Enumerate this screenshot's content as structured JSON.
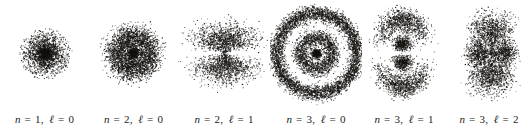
{
  "figure": {
    "name": "hydrogen-electron-probability-clouds",
    "width": 532,
    "height": 137,
    "background_color": "#ffffff",
    "dot_color": "#15120f",
    "caption_color": "#201d1b"
  },
  "orbitals": [
    {
      "id": "1s",
      "label": {
        "n_symbol": "n",
        "equals": "=",
        "n_value": "1",
        "separator": ",",
        "l_symbol": "ℓ",
        "l_value": "0",
        "text": "n = 1, ℓ = 0"
      },
      "quantum_numbers": {
        "n": 1,
        "l": 0
      },
      "center": {
        "x": 45,
        "y": 53
      },
      "label_y": 113,
      "panel": {
        "x": 0,
        "y": 0,
        "width": 89
      },
      "cloud": {
        "type": "spherical",
        "dots": 2600,
        "radial_peaks": [
          0.0
        ],
        "scale": 13.5,
        "max_radius": 26,
        "nodes": 0,
        "angular": "isotropic",
        "dot_size": 0.62
      }
    },
    {
      "id": "2s",
      "label": {
        "n_symbol": "n",
        "equals": "=",
        "n_value": "2",
        "separator": ",",
        "l_symbol": "ℓ",
        "l_value": "0",
        "text": "n = 2, ℓ = 0"
      },
      "quantum_numbers": {
        "n": 2,
        "l": 0
      },
      "center": {
        "x": 133,
        "y": 53
      },
      "label_y": 113,
      "panel": {
        "x": 89,
        "y": 0,
        "width": 89
      },
      "cloud": {
        "type": "spherical",
        "dots": 4200,
        "radial_peaks": [
          0.0,
          17.5
        ],
        "peak_weights": [
          0.18,
          0.82
        ],
        "peak_widths": [
          3.6,
          6.2
        ],
        "max_radius": 36,
        "nodes": 1,
        "angular": "isotropic",
        "dot_size": 0.6
      }
    },
    {
      "id": "2p",
      "label": {
        "n_symbol": "n",
        "equals": "=",
        "n_value": "2",
        "separator": ",",
        "l_symbol": "ℓ",
        "l_value": "1",
        "text": "n = 2, ℓ = 1"
      },
      "quantum_numbers": {
        "n": 2,
        "l": 1
      },
      "center": {
        "x": 224,
        "y": 53
      },
      "label_y": 113,
      "panel": {
        "x": 178,
        "y": 0,
        "width": 92
      },
      "cloud": {
        "type": "dumbbell",
        "dots": 5200,
        "radial_peaks": [
          18.0
        ],
        "peak_widths": [
          8.5
        ],
        "max_radius": 42,
        "nodes": 0,
        "angular": "cos2-vertical",
        "x_stretch": 1.45,
        "y_squash": 0.92,
        "dot_size": 0.6
      }
    },
    {
      "id": "3s",
      "label": {
        "n_symbol": "n",
        "equals": "=",
        "n_value": "3",
        "separator": ",",
        "l_symbol": "ℓ",
        "l_value": "0",
        "text": "n = 3, ℓ = 0"
      },
      "quantum_numbers": {
        "n": 3,
        "l": 0
      },
      "center": {
        "x": 316,
        "y": 53
      },
      "label_y": 113,
      "panel": {
        "x": 270,
        "y": 0,
        "width": 92
      },
      "cloud": {
        "type": "spherical",
        "dots": 7600,
        "radial_peaks": [
          0.0,
          16.0,
          40.0
        ],
        "peak_weights": [
          0.07,
          0.26,
          0.67
        ],
        "peak_widths": [
          2.8,
          4.0,
          3.6
        ],
        "max_radius": 50,
        "nodes": 2,
        "angular": "isotropic",
        "dot_size": 0.6
      }
    },
    {
      "id": "3p",
      "label": {
        "n_symbol": "n",
        "equals": "=",
        "n_value": "3",
        "separator": ",",
        "l_symbol": "ℓ",
        "l_value": "1",
        "text": "n = 3, ℓ = 1"
      },
      "quantum_numbers": {
        "n": 3,
        "l": 1
      },
      "center": {
        "x": 402,
        "y": 53
      },
      "label_y": 113,
      "panel": {
        "x": 362,
        "y": 0,
        "width": 84
      },
      "cloud": {
        "type": "dumbbell-multishell",
        "dots": 6400,
        "radial_peaks": [
          11.0,
          34.0
        ],
        "peak_weights": [
          0.3,
          0.7
        ],
        "peak_widths": [
          3.6,
          6.0
        ],
        "max_radius": 48,
        "nodes": 1,
        "angular": "cos2-vertical",
        "x_stretch": 0.78,
        "y_squash": 1.0,
        "dot_size": 0.6
      }
    },
    {
      "id": "3d",
      "label": {
        "n_symbol": "n",
        "equals": "=",
        "n_value": "3",
        "separator": ",",
        "l_symbol": "ℓ",
        "l_value": "2",
        "text": "n = 3, ℓ = 2"
      },
      "quantum_numbers": {
        "n": 3,
        "l": 2
      },
      "center": {
        "x": 491,
        "y": 53
      },
      "label_y": 113,
      "panel": {
        "x": 446,
        "y": 0,
        "width": 86
      },
      "cloud": {
        "type": "cloverleaf",
        "dots": 6200,
        "radial_peaks": [
          24.0
        ],
        "peak_widths": [
          10.0
        ],
        "max_radius": 48,
        "nodes": 0,
        "angular": "clover-4lobe",
        "lobe_ratio": 0.52,
        "x_stretch": 1.0,
        "y_squash": 1.0,
        "dot_size": 0.6
      }
    }
  ]
}
